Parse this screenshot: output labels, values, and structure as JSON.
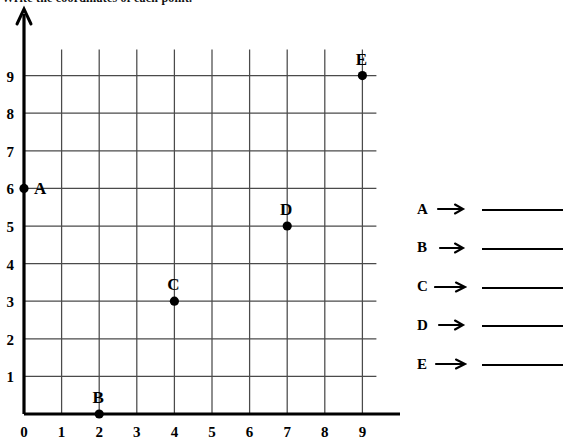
{
  "header": {
    "text": "Write the coordinates of each point."
  },
  "chart_data": {
    "type": "scatter",
    "title": "",
    "xlabel": "",
    "ylabel": "",
    "xlim": [
      0,
      9
    ],
    "ylim": [
      0,
      9
    ],
    "xticks": [
      "0",
      "1",
      "2",
      "3",
      "4",
      "5",
      "6",
      "7",
      "8",
      "9"
    ],
    "yticks": [
      "1",
      "2",
      "3",
      "4",
      "5",
      "6",
      "7",
      "8",
      "9"
    ],
    "grid": true,
    "legend": "none",
    "points": [
      {
        "label": "A",
        "x": 0,
        "y": 6,
        "label_pos": "right"
      },
      {
        "label": "B",
        "x": 2,
        "y": 0,
        "label_pos": "above"
      },
      {
        "label": "C",
        "x": 4,
        "y": 3,
        "label_pos": "above"
      },
      {
        "label": "D",
        "x": 7,
        "y": 5,
        "label_pos": "above"
      },
      {
        "label": "E",
        "x": 9,
        "y": 9,
        "label_pos": "above"
      }
    ]
  },
  "answers": {
    "rows": [
      {
        "letter": "A",
        "arrow": "arrow-right-icon",
        "value": ""
      },
      {
        "letter": "B",
        "arrow": "arrow-right-icon",
        "value": ""
      },
      {
        "letter": "C",
        "arrow": "arrow-right-icon",
        "value": ""
      },
      {
        "letter": "D",
        "arrow": "arrow-right-icon",
        "value": ""
      },
      {
        "letter": "E",
        "arrow": "arrow-right-icon",
        "value": ""
      }
    ]
  },
  "colors": {
    "ink": "#000000",
    "grid": "#4a4a4a",
    "background": "#ffffff"
  }
}
